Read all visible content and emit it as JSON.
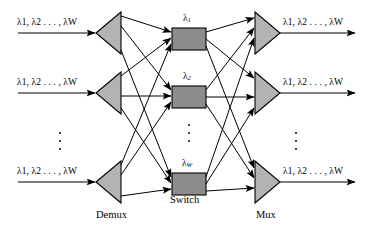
{
  "figure": {
    "colors": {
      "triangle_fill": "#b3b3b3",
      "switch_fill": "#8c8c8c",
      "stroke": "#000000",
      "background": "#ffffff"
    },
    "inputs": [
      {
        "label": "λ1, λ2 . . . , λW",
        "lambda_first": "λ",
        "sub_first": "1",
        "lambda_second": "λ",
        "sub_second": "2",
        "dots": ". . . ,",
        "lambda_last": "λ",
        "sub_last": "W"
      },
      {
        "label": "λ1, λ2 . . . , λW"
      },
      {
        "label": "λ1, λ2 . . . , λW"
      }
    ],
    "outputs": [
      {
        "label": "λ1, λ2 . . . , λW"
      },
      {
        "label": "λ1, λ2 . . . , λW"
      },
      {
        "label": "λ1, λ2 . . . , λW"
      }
    ],
    "switch_labels": [
      {
        "lambda": "λ",
        "sub": "1"
      },
      {
        "lambda": "λ",
        "sub": "2"
      },
      {
        "lambda": "λ",
        "sub": "W"
      }
    ],
    "stage_labels": {
      "demux": "Demux",
      "switch": "Switch",
      "mux": "Mux"
    },
    "ellipses": [
      {
        "name": "input-ellipsis"
      },
      {
        "name": "switch-ellipsis"
      },
      {
        "name": "output-ellipsis"
      }
    ]
  }
}
